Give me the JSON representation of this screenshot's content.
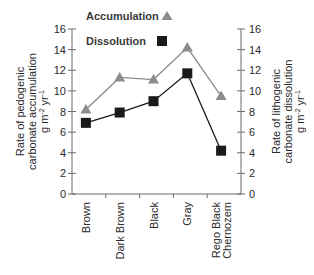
{
  "chart_data": {
    "type": "line",
    "title": "",
    "categories": [
      "Brown",
      "Dark Brown",
      "Black",
      "Gray",
      "Rego Black Chernozem"
    ],
    "category_lines": [
      [
        "Brown"
      ],
      [
        "Dark Brown"
      ],
      [
        "Black"
      ],
      [
        "Gray"
      ],
      [
        "Rego Black",
        "Chernozem"
      ]
    ],
    "series": [
      {
        "name": "Accumulation",
        "marker": "triangle",
        "color": "#8c8c8c",
        "axis": "left",
        "values": [
          8.2,
          11.3,
          11.1,
          14.2,
          9.5
        ]
      },
      {
        "name": "Dissolution",
        "marker": "square",
        "color": "#1a1a1a",
        "axis": "right",
        "values": [
          6.9,
          7.9,
          9.0,
          11.7,
          4.2
        ]
      }
    ],
    "ylabel_left": [
      "Rate of pedogenic",
      "carbonate accumulation",
      "g m-2 yr-1"
    ],
    "ylabel_right": [
      "Rate of lithogenic",
      "carbonate dissolution",
      "g m-2 yr-1"
    ],
    "ylim": [
      0,
      16
    ],
    "yticks": [
      0,
      2,
      4,
      6,
      8,
      10,
      12,
      14,
      16
    ],
    "grid": false,
    "legend_position": "top-center"
  },
  "legend": {
    "accumulation_label": "Accumulation",
    "dissolution_label": "Dissolution"
  }
}
